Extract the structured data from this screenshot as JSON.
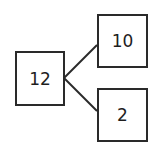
{
  "diagram": {
    "type": "number-bond",
    "whole": {
      "value": "12"
    },
    "parts": [
      {
        "value": "10"
      },
      {
        "value": "2"
      }
    ],
    "colors": {
      "stroke": "#2a2a2a",
      "text": "#1e1e1e",
      "background": "#ffffff"
    }
  }
}
